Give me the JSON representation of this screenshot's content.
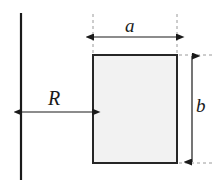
{
  "diagram": {
    "type": "engineering-dimension-diagram",
    "labels": {
      "width": "a",
      "height": "b",
      "offset": "R"
    },
    "colors": {
      "stroke": "#1a1a1a",
      "rect_fill": "#f2f2f2",
      "rect_border": "#262626",
      "dashed": "#8c8c8c",
      "background": "#ffffff"
    },
    "geometry": {
      "axis_line": {
        "x": 21,
        "y_top": 13,
        "y_bottom": 180
      },
      "rectangle": {
        "x": 93,
        "y": 55,
        "width": 84,
        "height": 108
      },
      "width_dimension": {
        "y": 37,
        "x_start": 93,
        "x_end": 177
      },
      "height_dimension": {
        "x": 192,
        "y_start": 55,
        "y_end": 163
      },
      "offset_dimension": {
        "y": 112,
        "x_start": 21,
        "x_end": 93
      }
    }
  }
}
